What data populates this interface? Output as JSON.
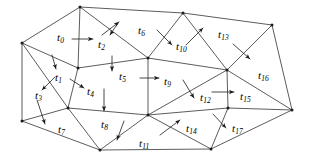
{
  "figure": {
    "type": "diagram",
    "width": 311,
    "height": 164,
    "background_color": "#ffffff",
    "edge_color": "#4a4a4a",
    "label_color": "#000000",
    "arrow_color": "#1a1a1a"
  },
  "vertices": [
    {
      "id": "v0",
      "name": "left",
      "x": 22,
      "y": 43
    },
    {
      "id": "v1",
      "name": "top-left",
      "x": 80,
      "y": 7
    },
    {
      "id": "v2",
      "name": "top-mid",
      "x": 183,
      "y": 13
    },
    {
      "id": "v3",
      "name": "top-right",
      "x": 272,
      "y": 25
    },
    {
      "id": "v4",
      "name": "left-lower",
      "x": 22,
      "y": 121
    },
    {
      "id": "v5",
      "name": "inner-left-up",
      "x": 78,
      "y": 68
    },
    {
      "id": "v6",
      "name": "inner-left-low",
      "x": 68,
      "y": 108
    },
    {
      "id": "v7",
      "name": "center-upper",
      "x": 148,
      "y": 58
    },
    {
      "id": "v8",
      "name": "center-hub",
      "x": 148,
      "y": 115
    },
    {
      "id": "v9",
      "name": "right-hub",
      "x": 227,
      "y": 70
    },
    {
      "id": "v10",
      "name": "right-low",
      "x": 228,
      "y": 108
    },
    {
      "id": "v11",
      "name": "far-right",
      "x": 292,
      "y": 110
    },
    {
      "id": "v12",
      "name": "bottom-left",
      "x": 100,
      "y": 150
    },
    {
      "id": "v13",
      "name": "bottom-right",
      "x": 211,
      "y": 149
    }
  ],
  "edges": [
    {
      "from": "v0",
      "to": "v1"
    },
    {
      "from": "v0",
      "to": "v5"
    },
    {
      "from": "v0",
      "to": "v6"
    },
    {
      "from": "v0",
      "to": "v4"
    },
    {
      "from": "v1",
      "to": "v5"
    },
    {
      "from": "v1",
      "to": "v7"
    },
    {
      "from": "v1",
      "to": "v2"
    },
    {
      "from": "v2",
      "to": "v7"
    },
    {
      "from": "v2",
      "to": "v9"
    },
    {
      "from": "v2",
      "to": "v3"
    },
    {
      "from": "v3",
      "to": "v9"
    },
    {
      "from": "v3",
      "to": "v11"
    },
    {
      "from": "v5",
      "to": "v7"
    },
    {
      "from": "v5",
      "to": "v6"
    },
    {
      "from": "v6",
      "to": "v4"
    },
    {
      "from": "v6",
      "to": "v8"
    },
    {
      "from": "v6",
      "to": "v12"
    },
    {
      "from": "v4",
      "to": "v12"
    },
    {
      "from": "v7",
      "to": "v8"
    },
    {
      "from": "v7",
      "to": "v9"
    },
    {
      "from": "v8",
      "to": "v9"
    },
    {
      "from": "v8",
      "to": "v10"
    },
    {
      "from": "v8",
      "to": "v12"
    },
    {
      "from": "v8",
      "to": "v13"
    },
    {
      "from": "v9",
      "to": "v10"
    },
    {
      "from": "v9",
      "to": "v11"
    },
    {
      "from": "v10",
      "to": "v11"
    },
    {
      "from": "v10",
      "to": "v13"
    },
    {
      "from": "v11",
      "to": "v13"
    },
    {
      "from": "v12",
      "to": "v13"
    }
  ],
  "triangle_labels": [
    {
      "id": "t0",
      "base": "t",
      "sub": "0",
      "x": 57,
      "y": 32
    },
    {
      "id": "t1",
      "base": "t",
      "sub": "1",
      "x": 55,
      "y": 72
    },
    {
      "id": "t2",
      "base": "t",
      "sub": "2",
      "x": 98,
      "y": 39
    },
    {
      "id": "t3",
      "base": "t",
      "sub": "3",
      "x": 35,
      "y": 90
    },
    {
      "id": "t4",
      "base": "t",
      "sub": "4",
      "x": 87,
      "y": 86
    },
    {
      "id": "t5",
      "base": "t",
      "sub": "5",
      "x": 119,
      "y": 71
    },
    {
      "id": "t6",
      "base": "t",
      "sub": "6",
      "x": 138,
      "y": 25
    },
    {
      "id": "t7",
      "base": "t",
      "sub": "7",
      "x": 58,
      "y": 124
    },
    {
      "id": "t8",
      "base": "t",
      "sub": "8",
      "x": 101,
      "y": 119
    },
    {
      "id": "t9",
      "base": "t",
      "sub": "9",
      "x": 164,
      "y": 76
    },
    {
      "id": "t10",
      "base": "t",
      "sub": "10",
      "x": 176,
      "y": 41
    },
    {
      "id": "t11",
      "base": "t",
      "sub": "11",
      "x": 139,
      "y": 138
    },
    {
      "id": "t12",
      "base": "t",
      "sub": "12",
      "x": 200,
      "y": 92
    },
    {
      "id": "t13",
      "base": "t",
      "sub": "13",
      "x": 218,
      "y": 29
    },
    {
      "id": "t14",
      "base": "t",
      "sub": "14",
      "x": 186,
      "y": 123
    },
    {
      "id": "t15",
      "base": "t",
      "sub": "15",
      "x": 240,
      "y": 91
    },
    {
      "id": "t16",
      "base": "t",
      "sub": "16",
      "x": 258,
      "y": 70
    },
    {
      "id": "t17",
      "base": "t",
      "sub": "17",
      "x": 232,
      "y": 123
    }
  ],
  "arrows": [
    {
      "id": "a0",
      "for": "t0",
      "x1": 72,
      "y1": 39,
      "x2": 93,
      "y2": 39
    },
    {
      "id": "a1",
      "for": "t1",
      "x1": 52,
      "y1": 55,
      "x2": 56,
      "y2": 69
    },
    {
      "id": "a2",
      "for": "t2",
      "x1": 118,
      "y1": 23,
      "x2": 110,
      "y2": 35
    },
    {
      "id": "a3",
      "for": "t3",
      "x1": 55,
      "y1": 77,
      "x2": 42,
      "y2": 90
    },
    {
      "id": "a4",
      "for": "t4",
      "x1": 70,
      "y1": 79,
      "x2": 84,
      "y2": 88
    },
    {
      "id": "a5",
      "for": "t5",
      "x1": 112,
      "y1": 56,
      "x2": 112,
      "y2": 71
    },
    {
      "id": "a6",
      "for": "t6",
      "x1": 102,
      "y1": 35,
      "x2": 119,
      "y2": 22
    },
    {
      "id": "a7",
      "for": "t7",
      "x1": 37,
      "y1": 100,
      "x2": 45,
      "y2": 124
    },
    {
      "id": "a8",
      "for": "t8",
      "x1": 104,
      "y1": 89,
      "x2": 104,
      "y2": 111
    },
    {
      "id": "a9",
      "for": "t9",
      "x1": 140,
      "y1": 78,
      "x2": 159,
      "y2": 78
    },
    {
      "id": "a10",
      "for": "t10",
      "x1": 157,
      "y1": 30,
      "x2": 172,
      "y2": 45
    },
    {
      "id": "a11",
      "for": "t11",
      "x1": 124,
      "y1": 121,
      "x2": 117,
      "y2": 140
    },
    {
      "id": "a12",
      "for": "t12",
      "x1": 183,
      "y1": 80,
      "x2": 194,
      "y2": 98
    },
    {
      "id": "a13",
      "for": "t13",
      "x1": 186,
      "y1": 45,
      "x2": 203,
      "y2": 28
    },
    {
      "id": "a14",
      "for": "t14",
      "x1": 160,
      "y1": 135,
      "x2": 180,
      "y2": 120
    },
    {
      "id": "a15",
      "for": "t15",
      "x1": 212,
      "y1": 92,
      "x2": 234,
      "y2": 92
    },
    {
      "id": "a16",
      "for": "t16",
      "x1": 233,
      "y1": 44,
      "x2": 250,
      "y2": 59
    },
    {
      "id": "a17",
      "for": "t17",
      "x1": 213,
      "y1": 114,
      "x2": 226,
      "y2": 128
    }
  ]
}
